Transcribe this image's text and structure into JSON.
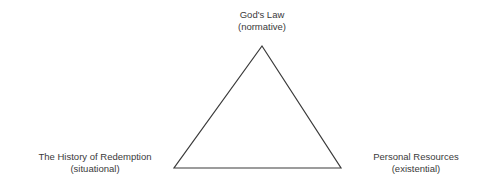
{
  "diagram": {
    "shape": "triangle",
    "stroke_color": "#3a3a3a",
    "background_color": "#ffffff",
    "text_color": "#3a3a3a",
    "vertices": [
      {
        "id": "apex",
        "x": 262,
        "y": 46
      },
      {
        "id": "bottom-left",
        "x": 174,
        "y": 168
      },
      {
        "id": "bottom-right",
        "x": 341,
        "y": 168
      }
    ],
    "labels": {
      "top": {
        "line1": "God's Law",
        "line2": "(normative)"
      },
      "left": {
        "line1": "The History of Redemption",
        "line2": "(situational)"
      },
      "right": {
        "line1": "Personal Resources",
        "line2": "(existential)"
      }
    }
  }
}
